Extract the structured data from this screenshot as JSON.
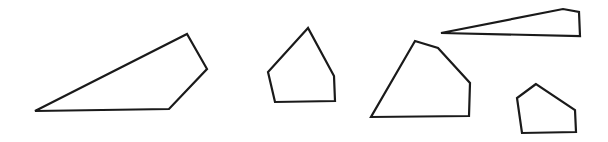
{
  "canvas": {
    "width": 608,
    "height": 142,
    "background": "#ffffff",
    "stroke_color": "#1a1a1a"
  },
  "shapes": [
    {
      "id": "quadrilateral-left",
      "points": "35,111 187,34 207,69 169,109"
    },
    {
      "id": "pentagon-middle",
      "points": "308,28 268,72 275,102 335,101 334,76"
    },
    {
      "id": "pentagon-large",
      "points": "415,41 438,48 470,83 469,116 371,117"
    },
    {
      "id": "thin-quadrilateral-top",
      "points": "441,33 563,9 579,12 580,36"
    },
    {
      "id": "pentagon-small",
      "points": "536,84 517,98 522,133 576,132 575,110"
    }
  ]
}
